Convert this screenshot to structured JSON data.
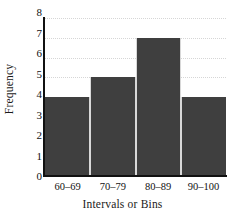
{
  "chart_data": {
    "type": "bar",
    "title": "",
    "subtitle": "",
    "xlabel": "Intervals or Bins",
    "ylabel": "Frequency",
    "categories": [
      "60–69",
      "70–79",
      "80–89",
      "90–100"
    ],
    "values": [
      4,
      5,
      7,
      4
    ],
    "series": [
      {
        "name": "Frequency",
        "values": [
          4,
          5,
          7,
          4
        ]
      }
    ],
    "ylim": [
      0,
      8
    ],
    "y_ticks": [
      0,
      1,
      2,
      3,
      4,
      5,
      6,
      7,
      8
    ],
    "y_tick_labels": [
      "0",
      "1",
      "2",
      "3",
      "4",
      "5",
      "6",
      "7",
      "8"
    ],
    "grid": true,
    "grid_axis": "y",
    "legend": false,
    "legend_position": "none",
    "annotations": [],
    "colors": {
      "bar_fill": "#3f3f3f",
      "bar_separator": "#d8d8d8",
      "axis": "#111111",
      "gridline": "#cfcfcf",
      "text": "#111111",
      "background": "#ffffff"
    }
  }
}
